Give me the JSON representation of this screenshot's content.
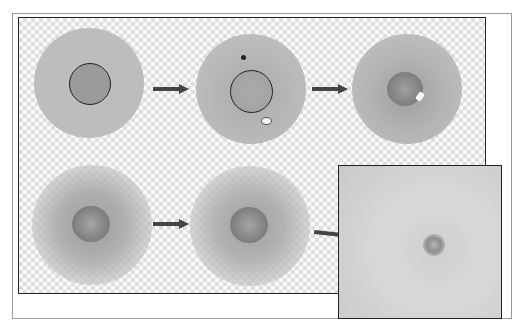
{
  "figure": {
    "colors": {
      "disc_gray": "#b8b8b8",
      "inner_disc": "#9a9a9a",
      "arrow": "#444444",
      "frame": "#222222",
      "checker_light": "#fafafa",
      "checker_dark": "#dedede"
    },
    "steps": [
      {
        "id": 1,
        "row": 1,
        "label": ""
      },
      {
        "id": 2,
        "row": 1,
        "label": ""
      },
      {
        "id": 3,
        "row": 1,
        "label": ""
      },
      {
        "id": 4,
        "row": 2,
        "label": ""
      },
      {
        "id": 5,
        "row": 2,
        "label": ""
      },
      {
        "id": 6,
        "row": 2,
        "label": "",
        "type": "photo-inset"
      }
    ],
    "arrows_count": 4
  }
}
